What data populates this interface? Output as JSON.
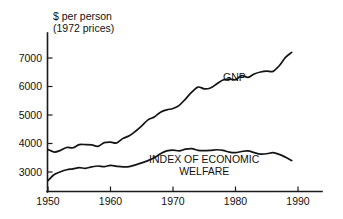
{
  "chart_data": {
    "type": "line",
    "title": "",
    "ylabel_lines": [
      "$ per person",
      "(1972 prices)"
    ],
    "xlabel": "",
    "ylabel": "$ per person (1972 prices)",
    "grid": false,
    "legend_position": "inline-annotation",
    "xlim": [
      1950,
      1993
    ],
    "ylim": [
      2550,
      7500
    ],
    "xticks": [
      1950,
      1960,
      1970,
      1980,
      1990
    ],
    "xtick_labels": [
      "1950",
      "1960",
      "1970",
      "1980",
      "1990"
    ],
    "yticks": [
      3000,
      4000,
      5000,
      6000,
      7000
    ],
    "ytick_labels": [
      "3000",
      "4000",
      "5000",
      "6000",
      "7000"
    ],
    "series": [
      {
        "name": "GNP",
        "label": "GNP",
        "label_x": 1978,
        "label_y": 6180,
        "x": [
          1950,
          1951,
          1952,
          1953,
          1954,
          1955,
          1956,
          1957,
          1958,
          1959,
          1960,
          1961,
          1962,
          1963,
          1964,
          1965,
          1966,
          1967,
          1968,
          1969,
          1970,
          1971,
          1972,
          1973,
          1974,
          1975,
          1976,
          1977,
          1978,
          1979,
          1980,
          1981,
          1982,
          1983,
          1984,
          1985,
          1986,
          1987,
          1988,
          1989
        ],
        "values": [
          3790,
          3700,
          3760,
          3860,
          3850,
          3960,
          3960,
          3950,
          3900,
          4030,
          4050,
          4020,
          4180,
          4270,
          4430,
          4620,
          4830,
          4930,
          5100,
          5180,
          5230,
          5340,
          5560,
          5800,
          5980,
          5920,
          5950,
          6090,
          6230,
          6260,
          6240,
          6380,
          6320,
          6440,
          6510,
          6540,
          6530,
          6730,
          7020,
          7200
        ]
      },
      {
        "name": "INDEX OF ECONOMIC WELFARE",
        "label": "INDEX OF ECONOMIC WELFARE",
        "label_lines": [
          "INDEX OF ECONOMIC",
          "WELFARE"
        ],
        "label_x": 1975,
        "label_y": 3310,
        "x": [
          1950,
          1951,
          1952,
          1953,
          1954,
          1955,
          1956,
          1957,
          1958,
          1959,
          1960,
          1961,
          1962,
          1963,
          1964,
          1965,
          1966,
          1967,
          1968,
          1969,
          1970,
          1971,
          1972,
          1973,
          1974,
          1975,
          1976,
          1977,
          1978,
          1979,
          1980,
          1981,
          1982,
          1983,
          1984,
          1985,
          1986,
          1987,
          1988,
          1989
        ],
        "values": [
          2700,
          2910,
          3010,
          3080,
          3110,
          3150,
          3130,
          3180,
          3210,
          3190,
          3230,
          3200,
          3180,
          3190,
          3250,
          3320,
          3400,
          3500,
          3640,
          3740,
          3770,
          3740,
          3800,
          3820,
          3760,
          3750,
          3760,
          3780,
          3760,
          3700,
          3680,
          3720,
          3740,
          3680,
          3630,
          3640,
          3680,
          3620,
          3520,
          3400
        ]
      }
    ]
  }
}
